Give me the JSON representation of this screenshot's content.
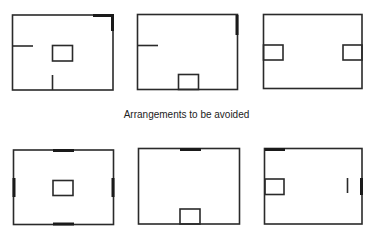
{
  "caption": "Arrangements to be avoided",
  "colors": {
    "line": "#2a2a2a",
    "background": "#ffffff"
  },
  "diagrams": [
    {
      "id": "room-1",
      "row": "top",
      "features": [
        "centered rectangle",
        "left wall stub",
        "bottom wall stub",
        "heavy top-right corner"
      ]
    },
    {
      "id": "room-2",
      "row": "top",
      "features": [
        "left wall stub",
        "rectangle at bottom wall",
        "heavy right wall segment"
      ]
    },
    {
      "id": "room-3",
      "row": "top",
      "features": [
        "rectangle at left wall",
        "rectangle at right wall"
      ]
    },
    {
      "id": "room-4",
      "row": "bottom",
      "features": [
        "centered rectangle",
        "heavy marks centered on all four walls"
      ]
    },
    {
      "id": "room-5",
      "row": "bottom",
      "features": [
        "heavy mark at top wall",
        "rectangle at bottom wall"
      ]
    },
    {
      "id": "room-6",
      "row": "bottom",
      "features": [
        "heavy mark top-left",
        "rectangle at left wall",
        "interior vertical stub",
        "heavy right wall segment"
      ]
    }
  ]
}
